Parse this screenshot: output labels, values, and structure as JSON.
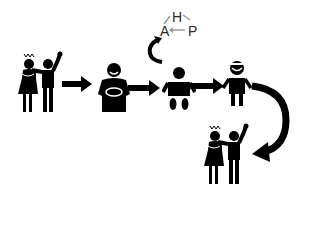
{
  "diagram": {
    "colors": {
      "foreground": "#000000",
      "background": "#ffffff",
      "hap_text": "#2a2a2a",
      "hap_arrows": "#9a9a9a"
    },
    "stages": [
      {
        "id": "violence-1",
        "label": "domestic violence scene"
      },
      {
        "id": "mother",
        "label": "mother holding baby"
      },
      {
        "id": "baby",
        "label": "baby"
      },
      {
        "id": "child",
        "label": "child"
      },
      {
        "id": "violence-2",
        "label": "domestic violence scene repeated"
      }
    ],
    "hap_cycle": {
      "top": "H",
      "left": "A",
      "right": "P"
    }
  }
}
